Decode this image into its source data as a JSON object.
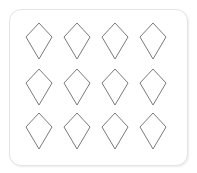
{
  "card": {
    "border_color": "#e4e4e4",
    "background": "#ffffff"
  },
  "grid": {
    "rows": 3,
    "columns": 4,
    "shape": "kite-icon",
    "stroke_color": "#7a7a7a",
    "items": [
      {
        "row": 1,
        "col": 1
      },
      {
        "row": 1,
        "col": 2
      },
      {
        "row": 1,
        "col": 3
      },
      {
        "row": 1,
        "col": 4
      },
      {
        "row": 2,
        "col": 1
      },
      {
        "row": 2,
        "col": 2
      },
      {
        "row": 2,
        "col": 3
      },
      {
        "row": 2,
        "col": 4
      },
      {
        "row": 3,
        "col": 1
      },
      {
        "row": 3,
        "col": 2
      },
      {
        "row": 3,
        "col": 3
      },
      {
        "row": 3,
        "col": 4
      }
    ]
  }
}
